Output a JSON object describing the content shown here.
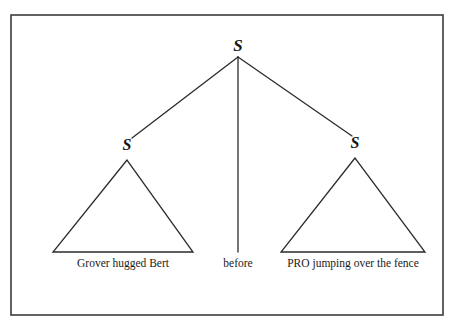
{
  "figure": {
    "kind": "syntax-tree",
    "frame": {
      "x": 11,
      "y": 15,
      "width": 432,
      "height": 300,
      "stroke_color": "#3c3c3c",
      "stroke_width": 1.6,
      "fill_color": "#ffffff"
    },
    "line_color": "#2b2b2b",
    "line_width": 1.3,
    "text_color": "#1a1a1a"
  },
  "tree": {
    "root": {
      "label": "S",
      "x": 238,
      "y": 45
    },
    "nodes": [
      {
        "id": "left-s",
        "label": "S",
        "x": 127,
        "y": 145
      },
      {
        "id": "right-s",
        "label": "S",
        "x": 355,
        "y": 143
      }
    ],
    "branches": [
      {
        "id": "root-to-left",
        "x1": 238,
        "y1": 57,
        "x2": 132,
        "y2": 138
      },
      {
        "id": "root-to-middle",
        "x1": 238,
        "y1": 57,
        "x2": 238,
        "y2": 252
      },
      {
        "id": "root-to-right",
        "x1": 238,
        "y1": 57,
        "x2": 352,
        "y2": 136
      }
    ],
    "triangles": [
      {
        "id": "left-triangle",
        "apex_x": 127,
        "apex_y": 160,
        "base_left_x": 53,
        "base_right_x": 193,
        "base_y": 252
      },
      {
        "id": "right-triangle",
        "apex_x": 355,
        "apex_y": 158,
        "base_left_x": 281,
        "base_right_x": 425,
        "base_y": 252
      }
    ],
    "terminals": [
      {
        "id": "left-terminal",
        "text": "Grover hugged Bert",
        "x": 123,
        "y": 258
      },
      {
        "id": "middle-terminal",
        "text": "before",
        "x": 238,
        "y": 258
      },
      {
        "id": "right-terminal",
        "text": "PRO jumping over the fence",
        "x": 353,
        "y": 258
      }
    ]
  }
}
